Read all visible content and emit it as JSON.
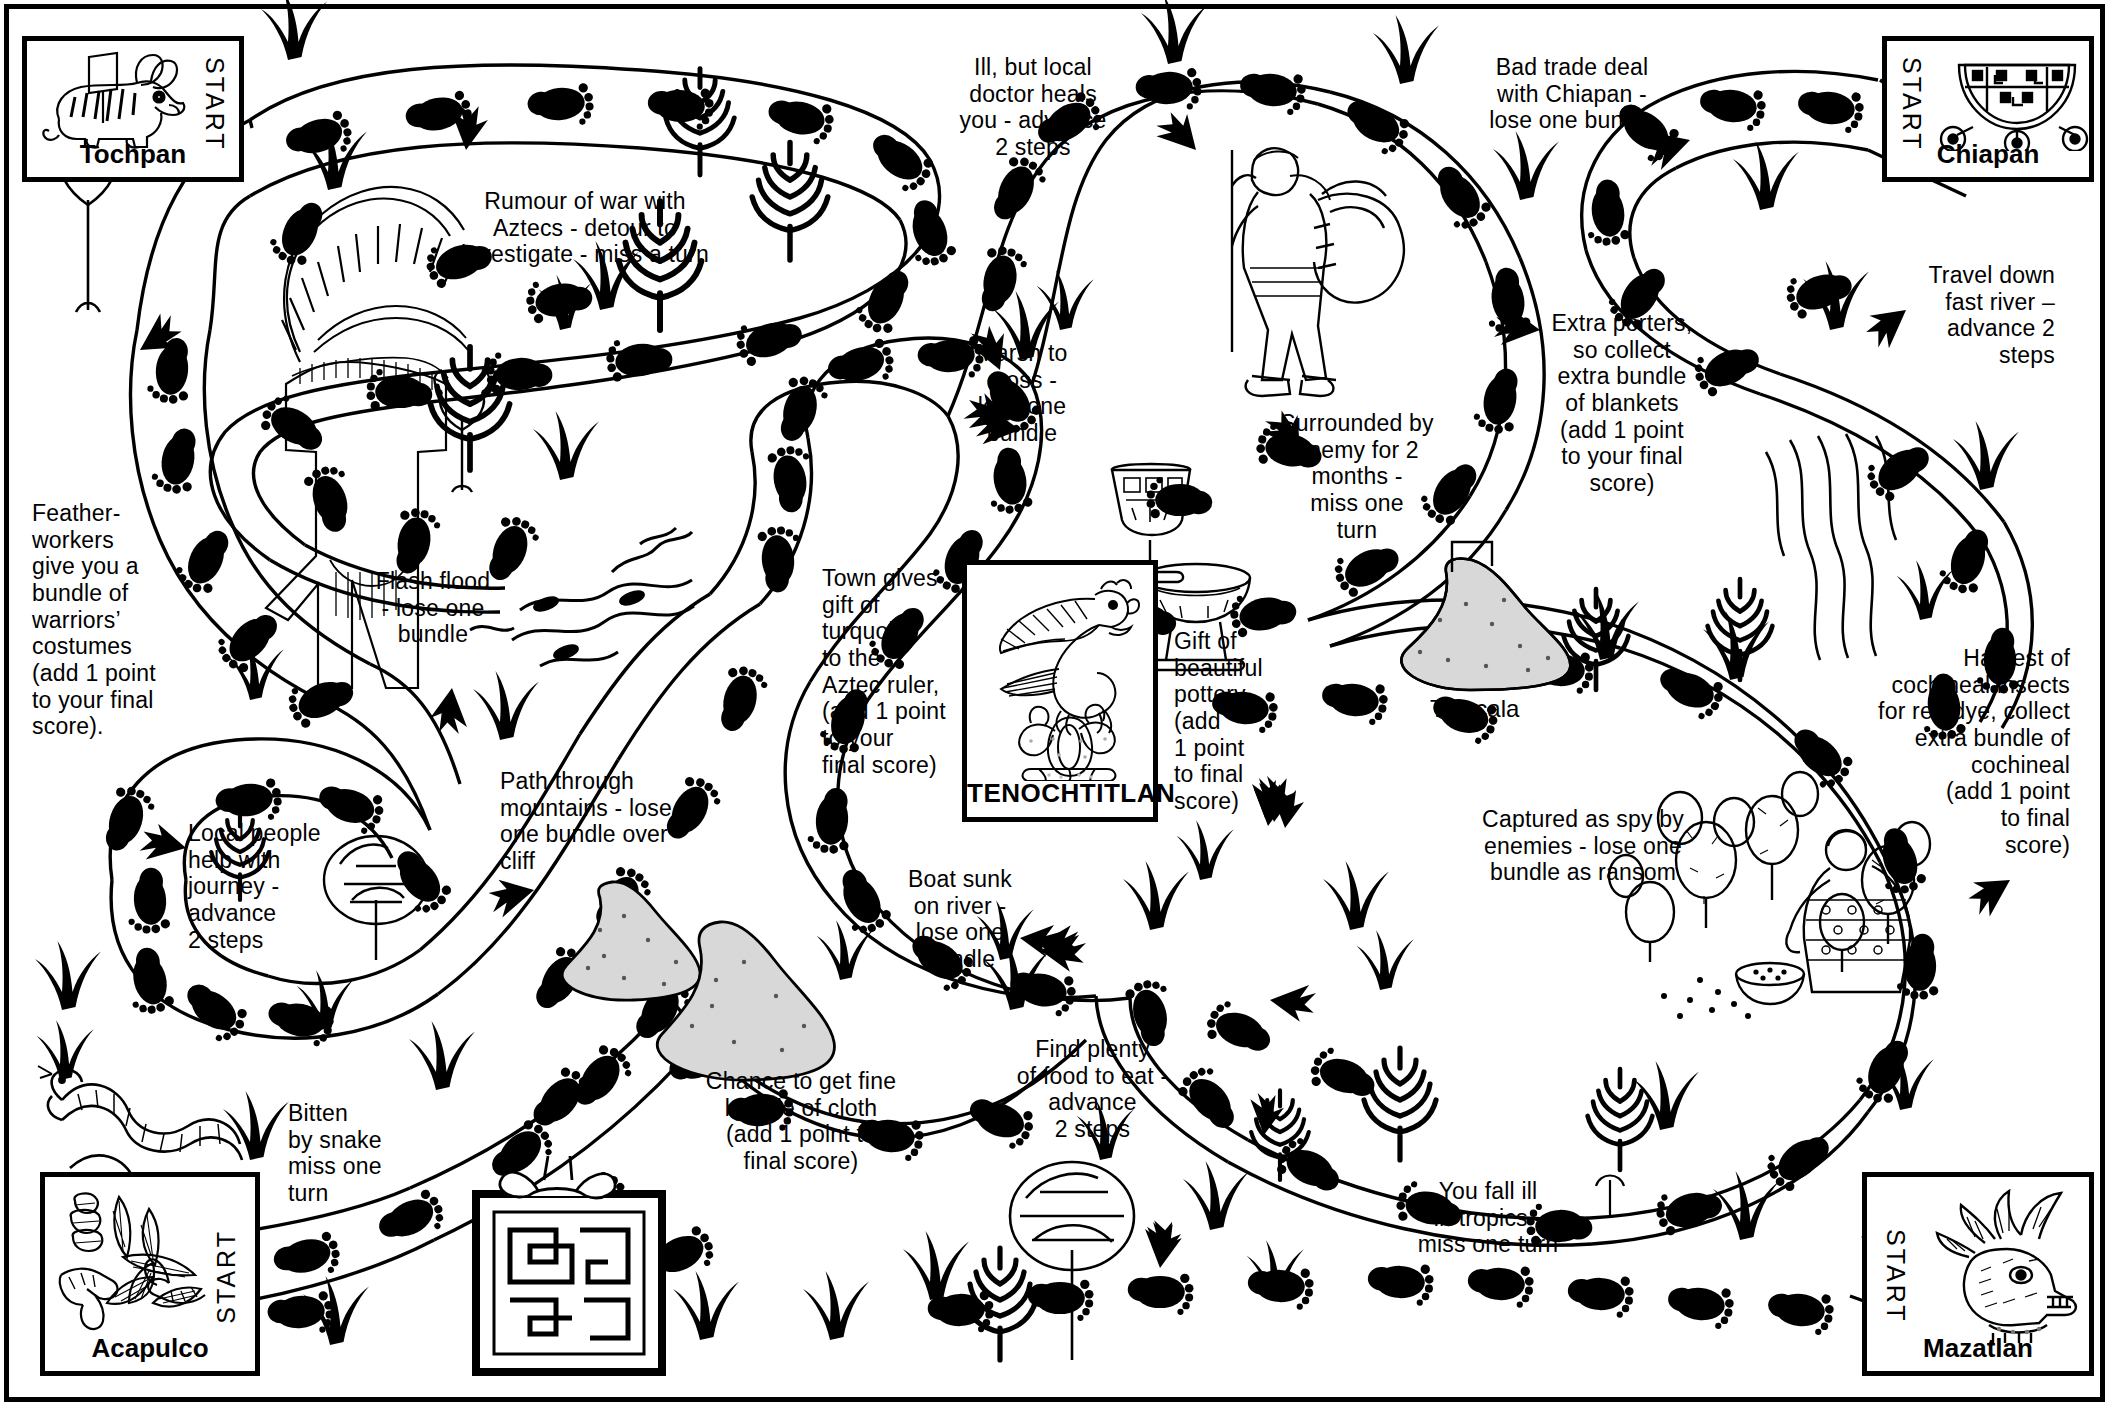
{
  "board": {
    "title": "Aztec Trade Route Board Game",
    "ink_color": "#000000",
    "paper_color": "#ffffff"
  },
  "destination_card": {
    "name": "TENOCHTITLAN",
    "icon": "eagle-on-cactus-icon"
  },
  "start_boxes": [
    {
      "id": "tochpan",
      "city": "Tochpan",
      "start_label": "START",
      "icon": "rabbit-glyph-icon"
    },
    {
      "id": "chiapan",
      "city": "Chiapan",
      "start_label": "START",
      "icon": "wheeled-shrine-glyph-icon"
    },
    {
      "id": "acapulco",
      "city": "Acapulco",
      "start_label": "START",
      "icon": "reeds-and-hands-glyph-icon"
    },
    {
      "id": "mazatlan",
      "city": "Mazatlan",
      "start_label": "START",
      "icon": "deer-head-glyph-icon"
    }
  ],
  "place_labels": [
    {
      "id": "tlaxcala",
      "text": "Tlaxcala"
    }
  ],
  "event_notes": [
    {
      "id": "rumour-of-war",
      "text": "Rumour of war with\nAztecs - detour to\ninvestigate - miss a turn"
    },
    {
      "id": "ill-local-doctor",
      "text": "Ill, but local\ndoctor heals\nyou - advance\n2 steps"
    },
    {
      "id": "bad-trade-deal",
      "text": "Bad trade deal\nwith Chiapan -\nlose one bundle"
    },
    {
      "id": "travel-fast-river",
      "text": "Travel down\nfast river –\nadvance 2\nsteps"
    },
    {
      "id": "marsh-to-cross",
      "text": "Marsh to\ncross -\nlose one\nbundle"
    },
    {
      "id": "surrounded-by-enemy",
      "text": "Surrounded by\nenemy for 2\nmonths -\nmiss one\nturn"
    },
    {
      "id": "extra-porters",
      "text": "Extra porters,\nso collect\nextra bundle\nof blankets\n(add 1 point\nto your final\nscore)"
    },
    {
      "id": "feather-workers",
      "text": "Feather-\nworkers\ngive you a\nbundle of\nwarriors’\ncostumes\n(add 1 point\nto your final\nscore)."
    },
    {
      "id": "flash-flood",
      "text": "Flash flood\n- lose one\nbundle"
    },
    {
      "id": "town-gives-gift",
      "text": "Town gives\ngift of\nturquoise\nto the\nAztec ruler,\n(add 1 point\nto your\nfinal score)"
    },
    {
      "id": "gift-of-pottery",
      "text": "Gift of\nbeautiful\npottery\n(add\n1 point\nto final\nscore)"
    },
    {
      "id": "harvest-cochineal",
      "text": "Harvest of\ncochineal insects\nfor red dye, collect\nextra bundle of\ncochineal\n(add 1 point\nto final\nscore)"
    },
    {
      "id": "captured-as-spy",
      "text": "Captured as spy by\nenemies - lose one\nbundle as ransom"
    },
    {
      "id": "path-through-mountains",
      "text": "Path through\nmountains - lose\none bundle over\ncliff"
    },
    {
      "id": "local-people-help",
      "text": "Local people\nhelp with\njourney -\nadvance\n2 steps"
    },
    {
      "id": "boat-sunk",
      "text": "Boat sunk\non river -\nlose one\nbundle"
    },
    {
      "id": "bitten-by-snake",
      "text": "Bitten\nby snake\nmiss one\nturn"
    },
    {
      "id": "chance-fine-cloth",
      "text": "Chance to get fine\nbundle of cloth\n(add 1 point to\nfinal score)"
    },
    {
      "id": "find-plenty-food",
      "text": "Find plenty\nof food to eat -\nadvance\n2 steps"
    },
    {
      "id": "fall-ill-tropics",
      "text": "You fall ill\nin tropics -\nmiss one turn"
    }
  ],
  "decorative_icons": [
    {
      "id": "tree-upper-left",
      "name": "tree-icon"
    },
    {
      "id": "warrior-costume",
      "name": "feather-headdress-costume-icon"
    },
    {
      "id": "conifer-cluster-top",
      "name": "conifer-tree-icon"
    },
    {
      "id": "flood-waves",
      "name": "flood-waves-icon"
    },
    {
      "id": "porter-figure",
      "name": "porter-with-bundle-icon"
    },
    {
      "id": "goblet",
      "name": "turquoise-goblet-icon"
    },
    {
      "id": "pottery-bowl",
      "name": "pottery-bowl-icon"
    },
    {
      "id": "tlaxcala-mountain",
      "name": "mountain-glyph-icon"
    },
    {
      "id": "mountains-center",
      "name": "mountain-pair-icon"
    },
    {
      "id": "snake",
      "name": "snake-icon"
    },
    {
      "id": "woven-textile",
      "name": "woven-cloth-bundle-icon"
    },
    {
      "id": "cactus-harvest-scene",
      "name": "cochineal-cactus-harvest-icon"
    },
    {
      "id": "tree-bottom-center",
      "name": "leafy-tree-icon"
    },
    {
      "id": "grass-tufts",
      "name": "grass-tuft-icon"
    },
    {
      "id": "footprint",
      "name": "footprint-step-icon"
    },
    {
      "id": "direction-arrow",
      "name": "direction-arrow-icon"
    }
  ]
}
